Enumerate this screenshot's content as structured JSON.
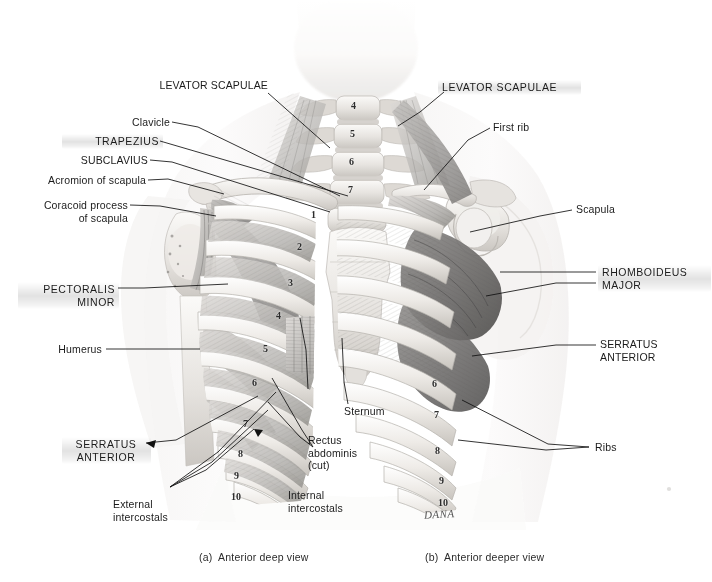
{
  "figure": {
    "colors": {
      "ink": "#1b1b1b",
      "leader": "#111111",
      "bone_light": "#f2f0ee",
      "bone_mid": "#d8d5d1",
      "muscle_light": "#cfcdca",
      "muscle_mid": "#a9a7a4",
      "muscle_dark": "#6f6e6d",
      "skin_ghost": "#f6f5f4",
      "background": "#ffffff"
    }
  },
  "captions": [
    {
      "id": "a",
      "text": "(a)  Anterior deep view"
    },
    {
      "id": "b",
      "text": "(b)  Anterior deeper view"
    }
  ],
  "labels_left_panel": [
    {
      "id": "levator-scapulae-a",
      "text": "LEVATOR SCAPULAE",
      "style": "plain"
    },
    {
      "id": "clavicle",
      "text": "Clavicle",
      "style": "plain"
    },
    {
      "id": "trapezius",
      "text": "TRAPEZIUS",
      "style": "muscle"
    },
    {
      "id": "subclavius",
      "text": "SUBCLAVIUS",
      "style": "plain"
    },
    {
      "id": "acromion-of-scapula",
      "text": "Acromion of scapula",
      "style": "plain"
    },
    {
      "id": "coracoid-process-of-scapula",
      "text": "Coracoid process\nof scapula",
      "style": "plain"
    },
    {
      "id": "pectoralis-minor",
      "text": "PECTORALIS\nMINOR",
      "style": "muscle"
    },
    {
      "id": "humerus",
      "text": "Humerus",
      "style": "plain"
    },
    {
      "id": "serratus-anterior-a",
      "text": "SERRATUS\nANTERIOR",
      "style": "muscle"
    },
    {
      "id": "external-intercostals",
      "text": "External\nintercostals",
      "style": "plain"
    },
    {
      "id": "internal-intercostals",
      "text": "Internal\nintercostals",
      "style": "plain"
    },
    {
      "id": "rectus-abdominis-cut",
      "text": "Rectus\nabdominis\n(cut)",
      "style": "plain"
    },
    {
      "id": "sternum",
      "text": "Sternum",
      "style": "plain"
    }
  ],
  "labels_right_panel": [
    {
      "id": "levator-scapulae-b",
      "text": "LEVATOR SCAPULAE",
      "style": "muscle"
    },
    {
      "id": "first-rib",
      "text": "First rib",
      "style": "plain"
    },
    {
      "id": "scapula",
      "text": "Scapula",
      "style": "plain"
    },
    {
      "id": "rhomboideus-major",
      "text": "RHOMBOIDEUS\nMAJOR",
      "style": "muscle"
    },
    {
      "id": "serratus-anterior-b",
      "text": "SERRATUS\nANTERIOR",
      "style": "plain"
    },
    {
      "id": "ribs",
      "text": "Ribs",
      "style": "plain"
    }
  ],
  "vertebrae_numbers": [
    "4",
    "5",
    "6",
    "7"
  ],
  "ribs_left_numbers": [
    "1",
    "2",
    "3",
    "4",
    "5",
    "6",
    "7",
    "8",
    "9",
    "10"
  ],
  "ribs_right_numbers": [
    "6",
    "7",
    "8",
    "9",
    "10"
  ],
  "signature": "DANA"
}
